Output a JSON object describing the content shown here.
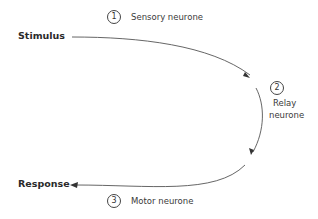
{
  "diagram": {
    "type": "reflex-arc",
    "nodes": {
      "start": "Stimulus",
      "end": "Response"
    },
    "steps": [
      {
        "number": "1",
        "label": "Sensory neurone"
      },
      {
        "number": "2",
        "label_line1": "Relay",
        "label_line2": "neurone"
      },
      {
        "number": "3",
        "label": "Motor neurone"
      }
    ],
    "colors": {
      "line": "#555555",
      "text": "#2a2a2a"
    }
  }
}
